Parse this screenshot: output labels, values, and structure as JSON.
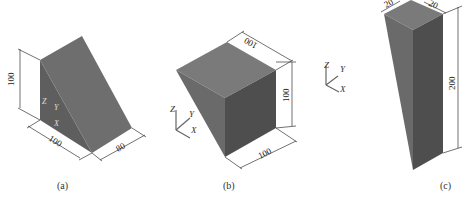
{
  "figures": [
    {
      "id": "a",
      "caption": "(a)",
      "shape": "triangular prism (wedge)",
      "dimensions": {
        "height": "100",
        "length": "100",
        "width": "80"
      },
      "axes": {
        "z": "Z",
        "y": "Y",
        "x": "X"
      }
    },
    {
      "id": "b",
      "caption": "(b)",
      "shape": "tapered block",
      "dimensions": {
        "top": "100",
        "height": "100",
        "bottom": "100"
      },
      "axes": {
        "z": "Z",
        "y": "Y",
        "x": "X"
      }
    },
    {
      "id": "c",
      "caption": "(c)",
      "shape": "tall tapered column",
      "dimensions": {
        "top_left": "20",
        "top_right": "20",
        "height": "200"
      },
      "axes": {
        "z": "Z",
        "y": "Y",
        "x": "X"
      }
    }
  ],
  "colors": {
    "face_light": "#7a7a7a",
    "face_mid": "#6a6a6a",
    "face_dark": "#555555",
    "line": "#333333"
  }
}
